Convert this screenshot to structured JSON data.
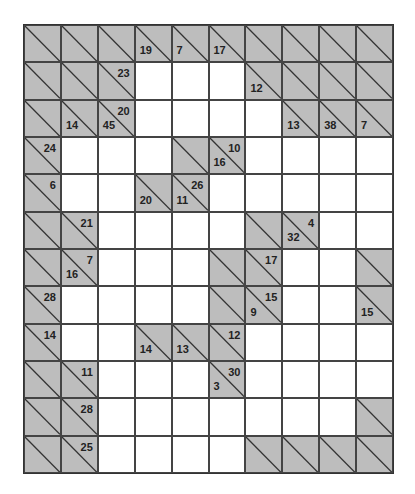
{
  "puzzle": {
    "type": "kakuro",
    "cols": 10,
    "rows": 12,
    "colors": {
      "block": "#bdbdbd",
      "white": "#ffffff",
      "line": "#444444",
      "text": "#222222"
    },
    "grid": [
      [
        {
          "t": "b"
        },
        {
          "t": "b"
        },
        {
          "t": "b"
        },
        {
          "t": "b",
          "down": "19"
        },
        {
          "t": "b",
          "down": "7"
        },
        {
          "t": "b",
          "down": "17"
        },
        {
          "t": "b"
        },
        {
          "t": "b"
        },
        {
          "t": "b"
        },
        {
          "t": "b"
        }
      ],
      [
        {
          "t": "b"
        },
        {
          "t": "b"
        },
        {
          "t": "b",
          "across": "23"
        },
        {
          "t": "w"
        },
        {
          "t": "w"
        },
        {
          "t": "w"
        },
        {
          "t": "b",
          "down": "12"
        },
        {
          "t": "b"
        },
        {
          "t": "b"
        },
        {
          "t": "b"
        }
      ],
      [
        {
          "t": "b"
        },
        {
          "t": "b",
          "down": "14"
        },
        {
          "t": "b",
          "down": "45",
          "across": "20"
        },
        {
          "t": "w"
        },
        {
          "t": "w"
        },
        {
          "t": "w"
        },
        {
          "t": "w"
        },
        {
          "t": "b",
          "down": "13"
        },
        {
          "t": "b",
          "down": "38"
        },
        {
          "t": "b",
          "down": "7"
        }
      ],
      [
        {
          "t": "b",
          "across": "24"
        },
        {
          "t": "w"
        },
        {
          "t": "w"
        },
        {
          "t": "w"
        },
        {
          "t": "b"
        },
        {
          "t": "b",
          "down": "16",
          "across": "10"
        },
        {
          "t": "w"
        },
        {
          "t": "w"
        },
        {
          "t": "w"
        },
        {
          "t": "w"
        }
      ],
      [
        {
          "t": "b",
          "across": "6"
        },
        {
          "t": "w"
        },
        {
          "t": "w"
        },
        {
          "t": "b",
          "down": "20"
        },
        {
          "t": "b",
          "down": "11",
          "across": "26"
        },
        {
          "t": "w"
        },
        {
          "t": "w"
        },
        {
          "t": "w"
        },
        {
          "t": "w"
        },
        {
          "t": "w"
        }
      ],
      [
        {
          "t": "b"
        },
        {
          "t": "b",
          "across": "21"
        },
        {
          "t": "w"
        },
        {
          "t": "w"
        },
        {
          "t": "w"
        },
        {
          "t": "w"
        },
        {
          "t": "b"
        },
        {
          "t": "b",
          "down": "32",
          "across": "4"
        },
        {
          "t": "w"
        },
        {
          "t": "w"
        }
      ],
      [
        {
          "t": "b"
        },
        {
          "t": "b",
          "down": "16",
          "across": "7"
        },
        {
          "t": "w"
        },
        {
          "t": "w"
        },
        {
          "t": "w"
        },
        {
          "t": "b"
        },
        {
          "t": "b",
          "across": "17"
        },
        {
          "t": "w"
        },
        {
          "t": "w"
        },
        {
          "t": "b"
        }
      ],
      [
        {
          "t": "b",
          "across": "28"
        },
        {
          "t": "w"
        },
        {
          "t": "w"
        },
        {
          "t": "w"
        },
        {
          "t": "w"
        },
        {
          "t": "b"
        },
        {
          "t": "b",
          "down": "9",
          "across": "15"
        },
        {
          "t": "w"
        },
        {
          "t": "w"
        },
        {
          "t": "b",
          "down": "15"
        }
      ],
      [
        {
          "t": "b",
          "across": "14"
        },
        {
          "t": "w"
        },
        {
          "t": "w"
        },
        {
          "t": "b",
          "down": "14"
        },
        {
          "t": "b",
          "down": "13"
        },
        {
          "t": "b",
          "across": "12"
        },
        {
          "t": "w"
        },
        {
          "t": "w"
        },
        {
          "t": "w"
        },
        {
          "t": "w"
        }
      ],
      [
        {
          "t": "b"
        },
        {
          "t": "b",
          "across": "11"
        },
        {
          "t": "w"
        },
        {
          "t": "w"
        },
        {
          "t": "w"
        },
        {
          "t": "b",
          "down": "3",
          "across": "30"
        },
        {
          "t": "w"
        },
        {
          "t": "w"
        },
        {
          "t": "w"
        },
        {
          "t": "w"
        }
      ],
      [
        {
          "t": "b"
        },
        {
          "t": "b",
          "across": "28"
        },
        {
          "t": "w"
        },
        {
          "t": "w"
        },
        {
          "t": "w"
        },
        {
          "t": "w"
        },
        {
          "t": "w"
        },
        {
          "t": "w"
        },
        {
          "t": "w"
        },
        {
          "t": "b"
        }
      ],
      [
        {
          "t": "b"
        },
        {
          "t": "b",
          "across": "25"
        },
        {
          "t": "w"
        },
        {
          "t": "w"
        },
        {
          "t": "w"
        },
        {
          "t": "w"
        },
        {
          "t": "b"
        },
        {
          "t": "b"
        },
        {
          "t": "b"
        },
        {
          "t": "b"
        }
      ]
    ]
  }
}
